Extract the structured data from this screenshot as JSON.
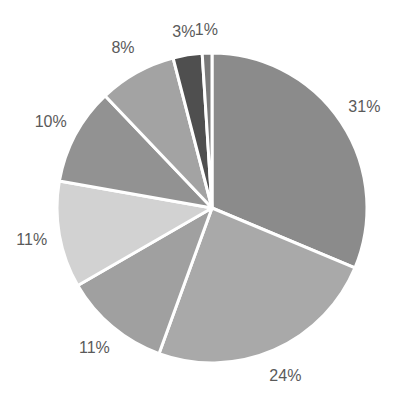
{
  "chart_data": {
    "type": "pie",
    "title": "",
    "start_angle": "12 o'clock",
    "direction": "clockwise",
    "legend": "none",
    "slices": [
      {
        "label": "31%",
        "value": 31,
        "color": "#8b8b8b"
      },
      {
        "label": "24%",
        "value": 24,
        "color": "#a9a9a9"
      },
      {
        "label": "11%",
        "value": 11,
        "color": "#a0a0a0"
      },
      {
        "label": "11%",
        "value": 11,
        "color": "#d2d2d2"
      },
      {
        "label": "10%",
        "value": 10,
        "color": "#929292"
      },
      {
        "label": "8%",
        "value": 8,
        "color": "#a3a3a3"
      },
      {
        "label": "3%",
        "value": 3,
        "color": "#4f4f4f"
      },
      {
        "label": "1%",
        "value": 1,
        "color": "#7a7a7a"
      }
    ]
  },
  "labels": [
    "31%",
    "24%",
    "11%",
    "11%",
    "10%",
    "8%",
    "3%",
    "1%"
  ]
}
